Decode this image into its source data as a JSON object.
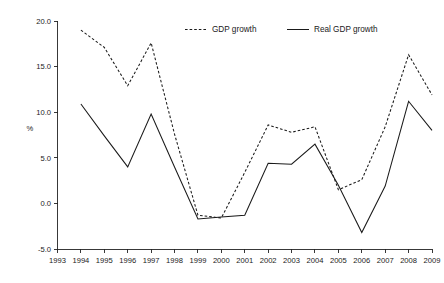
{
  "chart_data": {
    "type": "line",
    "title": "",
    "xlabel": "",
    "ylabel": "%",
    "x": [
      1993,
      1994,
      1995,
      1996,
      1997,
      1998,
      1999,
      2000,
      2001,
      2002,
      2003,
      2004,
      2005,
      2006,
      2007,
      2008,
      2009
    ],
    "xlim": [
      1993,
      2009
    ],
    "ylim": [
      -5.0,
      20.0
    ],
    "yticks": [
      -5.0,
      0.0,
      5.0,
      10.0,
      15.0,
      20.0
    ],
    "ytick_labels": [
      "-5.0",
      "0.0",
      "5.0",
      "10.0",
      "15.0",
      "20.0"
    ],
    "xtick_labels": [
      "1993",
      "1994",
      "1995",
      "1996",
      "1997",
      "1998",
      "1999",
      "2000",
      "2001",
      "2002",
      "2003",
      "2004",
      "2005",
      "2006",
      "2007",
      "2008",
      "2009"
    ],
    "grid": false,
    "legend_position": "top-center",
    "series": [
      {
        "name": "GDP growth",
        "style": "dashed",
        "color": "#1a1a1a",
        "x": [
          1994,
          1995,
          1996,
          1997,
          1998,
          1999,
          2000,
          2001,
          2002,
          2003,
          2004,
          2005,
          2006,
          2007,
          2008,
          2009
        ],
        "values": [
          19.0,
          17.1,
          12.9,
          17.6,
          7.6,
          -1.3,
          -1.6,
          3.4,
          8.6,
          7.8,
          8.4,
          1.5,
          2.6,
          8.4,
          16.3,
          11.9
        ]
      },
      {
        "name": "Real GDP growth",
        "style": "solid",
        "color": "#1a1a1a",
        "x": [
          1994,
          1995,
          1996,
          1997,
          1998,
          1999,
          2000,
          2001,
          2002,
          2003,
          2004,
          2005,
          2006,
          2007,
          2008,
          2009
        ],
        "values": [
          10.9,
          7.4,
          4.0,
          9.8,
          4.0,
          -1.7,
          -1.5,
          -1.3,
          4.4,
          4.3,
          6.5,
          2.0,
          -3.2,
          1.9,
          11.2,
          8.0
        ]
      }
    ]
  },
  "legend": {
    "items": [
      {
        "label": "GDP growth",
        "style": "dashed"
      },
      {
        "label": "Real GDP growth",
        "style": "solid"
      }
    ]
  },
  "axes": {
    "y_axis_label": "%"
  }
}
